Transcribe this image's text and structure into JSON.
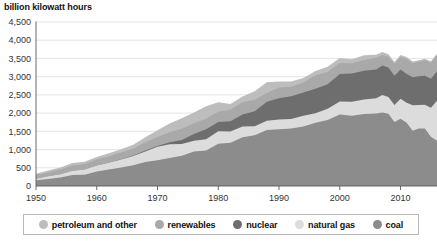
{
  "chart_data": {
    "type": "area",
    "stacked": true,
    "title": "billion kilowatt hours",
    "xlabel": "",
    "ylabel": "billion kilowatt hours",
    "xlim": [
      1950,
      2016
    ],
    "ylim": [
      0,
      4500
    ],
    "ytick_step": 500,
    "grid": true,
    "legend_position": "bottom",
    "ytick_labels": [
      "0",
      "500",
      "1,000",
      "1,500",
      "2,000",
      "2,500",
      "3,000",
      "3,500",
      "4,000",
      "4,500"
    ],
    "ytick_values": [
      0,
      500,
      1000,
      1500,
      2000,
      2500,
      3000,
      3500,
      4000,
      4500
    ],
    "xtick_labels": [
      "1950",
      "1960",
      "1970",
      "1980",
      "1990",
      "2000",
      "2010"
    ],
    "xtick_values": [
      1950,
      1960,
      1970,
      1980,
      1990,
      2000,
      2010
    ],
    "x": [
      1950,
      1952,
      1954,
      1956,
      1958,
      1960,
      1962,
      1964,
      1966,
      1968,
      1970,
      1972,
      1974,
      1976,
      1978,
      1980,
      1982,
      1984,
      1986,
      1988,
      1990,
      1992,
      1994,
      1996,
      1998,
      2000,
      2002,
      2004,
      2006,
      2007,
      2008,
      2009,
      2010,
      2011,
      2012,
      2013,
      2014,
      2015,
      2016
    ],
    "series": [
      {
        "name": "coal",
        "color": "#8c8c8c",
        "values": [
          155,
          195,
          230,
          300,
          310,
          400,
          450,
          510,
          570,
          660,
          705,
          770,
          830,
          945,
          975,
          1160,
          1190,
          1340,
          1390,
          1540,
          1560,
          1575,
          1635,
          1735,
          1810,
          1965,
          1930,
          1975,
          1990,
          2020,
          1985,
          1755,
          1845,
          1735,
          1515,
          1580,
          1580,
          1350,
          1240
        ]
      },
      {
        "name": "natural gas",
        "color": "#dcdcdc",
        "values": [
          45,
          70,
          95,
          120,
          140,
          160,
          185,
          215,
          250,
          290,
          370,
          375,
          320,
          295,
          305,
          345,
          305,
          295,
          250,
          250,
          265,
          265,
          290,
          260,
          310,
          355,
          380,
          400,
          420,
          480,
          460,
          470,
          550,
          550,
          700,
          640,
          650,
          800,
          1100
        ]
      },
      {
        "name": "nuclear",
        "color": "#6e6e6e",
        "values": [
          0,
          0,
          0,
          0,
          2,
          4,
          6,
          10,
          15,
          25,
          22,
          55,
          115,
          190,
          280,
          250,
          280,
          330,
          410,
          520,
          580,
          620,
          640,
          675,
          675,
          755,
          780,
          790,
          785,
          805,
          805,
          800,
          805,
          790,
          770,
          790,
          795,
          795,
          805
        ]
      },
      {
        "name": "renewables",
        "color": "#a9a9a9",
        "values": [
          100,
          115,
          125,
          140,
          150,
          160,
          175,
          185,
          195,
          225,
          250,
          275,
          305,
          290,
          285,
          285,
          315,
          330,
          320,
          245,
          295,
          265,
          275,
          370,
          330,
          300,
          280,
          290,
          325,
          290,
          305,
          330,
          340,
          420,
          390,
          400,
          425,
          430,
          440
        ]
      },
      {
        "name": "petroleum and other",
        "color": "#bdbdbd",
        "values": [
          35,
          45,
          55,
          70,
          65,
          75,
          80,
          90,
          105,
          135,
          185,
          240,
          290,
          300,
          345,
          260,
          160,
          160,
          230,
          290,
          170,
          140,
          125,
          115,
          150,
          140,
          110,
          135,
          80,
          85,
          60,
          50,
          55,
          45,
          40,
          40,
          45,
          45,
          45
        ]
      }
    ],
    "legend": [
      {
        "label": "petroleum and other",
        "color": "#bdbdbd"
      },
      {
        "label": "renewables",
        "color": "#a9a9a9"
      },
      {
        "label": "nuclear",
        "color": "#6e6e6e"
      },
      {
        "label": "natural gas",
        "color": "#dcdcdc"
      },
      {
        "label": "coal",
        "color": "#8c8c8c"
      }
    ]
  }
}
